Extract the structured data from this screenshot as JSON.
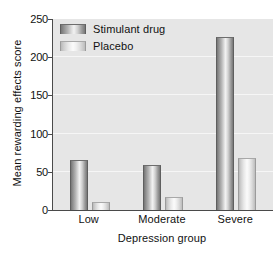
{
  "chart_data": {
    "type": "bar",
    "title": "",
    "subtitle": "",
    "xlabel": "Depression group",
    "ylabel": "Mean rewarding effects score",
    "categories": [
      "Low",
      "Moderate",
      "Severe"
    ],
    "series": [
      {
        "name": "Stimulant drug",
        "values": [
          65,
          59,
          227
        ],
        "color": "#8f8f8f"
      },
      {
        "name": "Placebo",
        "values": [
          10,
          17,
          68
        ],
        "color": "#dcdcdc"
      }
    ],
    "ylim": [
      0,
      250
    ],
    "yticks": [
      0,
      50,
      100,
      150,
      200,
      250
    ],
    "ytick_labels": [
      "0",
      "50",
      "100",
      "150",
      "200",
      "250"
    ],
    "grid": true,
    "grid_axis": "y",
    "legend_position": "top-left-inside",
    "plot_background": "#e6e6e6",
    "figure_background": "#ffffff",
    "axis_color": "#4a4a4a",
    "gridline_color": "#f6f6f6"
  },
  "legend": {
    "items": [
      {
        "label": "Stimulant drug",
        "swatch": "dark"
      },
      {
        "label": "Placebo",
        "swatch": "light"
      }
    ]
  },
  "axes": {
    "y_title": "Mean rewarding effects score",
    "x_title": "Depression group",
    "y_tick_labels": [
      "250",
      "200",
      "150",
      "100",
      "50",
      "0"
    ],
    "x_tick_labels": [
      "Low",
      "Moderate",
      "Severe"
    ]
  }
}
